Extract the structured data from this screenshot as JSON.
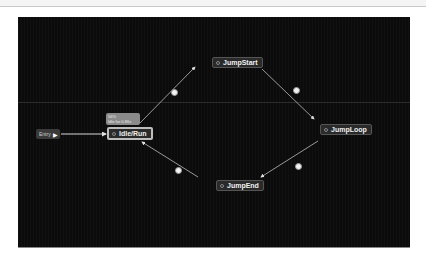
{
  "graph": {
    "entry": {
      "label": "Entry",
      "icon": "play-arrow-icon"
    },
    "info_label": {
      "percent": "56%",
      "status": "Idle for 0.86s"
    },
    "states": [
      {
        "id": "idle_run",
        "label": "Idle/Run",
        "active": true
      },
      {
        "id": "jump_start",
        "label": "JumpStart",
        "active": false
      },
      {
        "id": "jump_loop",
        "label": "JumpLoop",
        "active": false
      },
      {
        "id": "jump_end",
        "label": "JumpEnd",
        "active": false
      }
    ],
    "transitions": [
      {
        "from": "entry",
        "to": "Idle/Run"
      },
      {
        "from": "Idle/Run",
        "to": "JumpStart",
        "icon": "transition-icon"
      },
      {
        "from": "JumpStart",
        "to": "JumpLoop",
        "icon": "transition-icon"
      },
      {
        "from": "JumpLoop",
        "to": "JumpEnd",
        "icon": "transition-icon"
      },
      {
        "from": "JumpEnd",
        "to": "Idle/Run",
        "icon": "transition-icon"
      }
    ]
  }
}
